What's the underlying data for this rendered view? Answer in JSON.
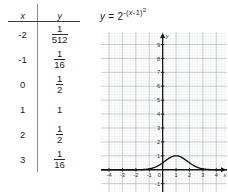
{
  "table": {
    "headers": {
      "x": "x",
      "y": "y"
    },
    "rows": [
      {
        "x": "-2",
        "y_num": "1",
        "y_den": "512",
        "y_text": "1/512"
      },
      {
        "x": "-1",
        "y_num": "1",
        "y_den": "16",
        "y_text": "1/16"
      },
      {
        "x": "0",
        "y_num": "1",
        "y_den": "2",
        "y_text": "1/2"
      },
      {
        "x": "1",
        "y_whole": "1",
        "y_text": "1"
      },
      {
        "x": "2",
        "y_num": "1",
        "y_den": "2",
        "y_text": "1/2"
      },
      {
        "x": "3",
        "y_num": "1",
        "y_den": "16",
        "y_text": "1/16"
      }
    ]
  },
  "equation": {
    "lhs": "y",
    "equals": "=",
    "base": "2",
    "exponent_sign": "-",
    "exponent_open": "(",
    "exponent_var": "x",
    "exponent_minus": "-",
    "exponent_const": "1",
    "exponent_close": ")",
    "exponent_power": "2",
    "full_text": "y = 2^-(x-1)^2"
  },
  "chart_data": {
    "type": "line",
    "title": "",
    "xlabel": "x",
    "ylabel": "y",
    "xlim": [
      -4.6,
      4.8
    ],
    "ylim": [
      -1.6,
      9.9
    ],
    "x_ticks": [
      "-4",
      "-3",
      "-2",
      "-1",
      "0",
      "1",
      "2",
      "3",
      "4"
    ],
    "x_tick_values": [
      -4,
      -3,
      -2,
      -1,
      0,
      1,
      2,
      3,
      4
    ],
    "y_ticks": [
      "9",
      "8",
      "7",
      "6",
      "5",
      "4",
      "3",
      "2",
      "1",
      "-1"
    ],
    "y_tick_values": [
      9,
      8,
      7,
      6,
      5,
      4,
      3,
      2,
      1,
      -1
    ],
    "grid": true,
    "minor_grid": true,
    "minor_per_major": 5,
    "legend": "none",
    "series": [
      {
        "name": "y = 2^-(x-1)^2",
        "x": [
          -4.5,
          -4,
          -3.5,
          -3,
          -2.5,
          -2,
          -1.5,
          -1,
          -0.5,
          0,
          0.25,
          0.5,
          0.75,
          1,
          1.25,
          1.5,
          1.75,
          2,
          2.5,
          3,
          3.5,
          4,
          4.5
        ],
        "values": [
          1e-07,
          1.9e-06,
          1.96e-05,
          0.00015,
          0.00086,
          0.00391,
          0.01381,
          0.0625,
          0.17678,
          0.5,
          0.68169,
          0.8409,
          0.9576,
          1,
          0.9576,
          0.8409,
          0.68169,
          0.5,
          0.17678,
          0.0625,
          0.01381,
          0.00391,
          0.00086
        ]
      }
    ],
    "peak": {
      "x": 1,
      "y": 1
    },
    "axis_arrows": {
      "x_right": true,
      "y_top": true
    },
    "colors": {
      "curve": "#111111",
      "axis": "#1a1a1a",
      "major_grid": "#b9bcc4",
      "minor_grid": "#e4e6ea",
      "background": "#ffffff"
    }
  }
}
